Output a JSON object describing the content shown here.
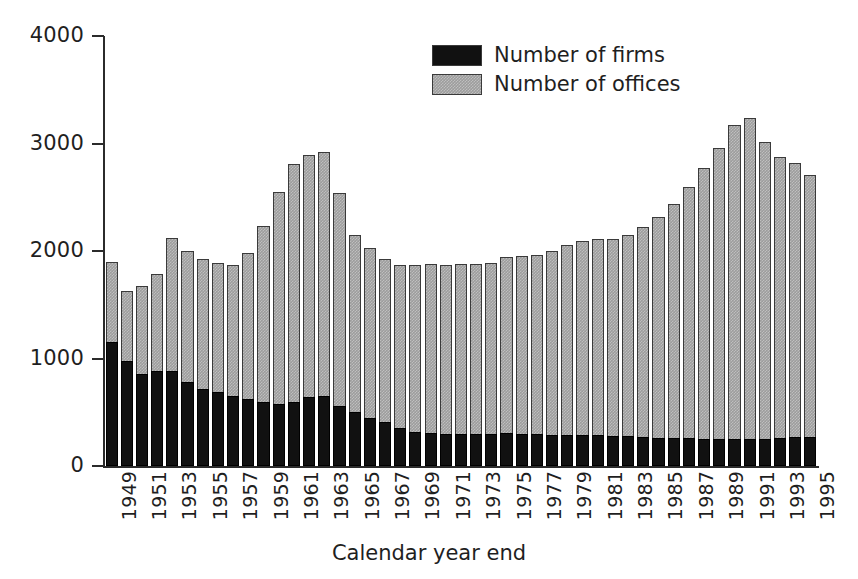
{
  "chart_data": {
    "type": "bar",
    "subtype": "stacked-vertical",
    "title": "",
    "xlabel": "Calendar year end",
    "ylabel": "",
    "ylim": [
      0,
      4000
    ],
    "ytick_values": [
      0,
      1000,
      2000,
      3000,
      4000
    ],
    "ytick_labels": [
      "0",
      "1000",
      "2000",
      "3000",
      "4000"
    ],
    "grid": false,
    "legend_position": "top-center-right",
    "colors": {
      "firms": "#111111",
      "offices": "#9d9d9d",
      "axis": "#2b2b2b",
      "text": "#1f1f1f",
      "background": "#ffffff"
    },
    "categories": [
      "1949",
      "1950",
      "1951",
      "1952",
      "1953",
      "1954",
      "1955",
      "1956",
      "1957",
      "1958",
      "1959",
      "1960",
      "1961",
      "1962",
      "1963",
      "1964",
      "1965",
      "1966",
      "1967",
      "1968",
      "1969",
      "1970",
      "1971",
      "1972",
      "1973",
      "1974",
      "1975",
      "1976",
      "1977",
      "1978",
      "1979",
      "1980",
      "1981",
      "1982",
      "1983",
      "1984",
      "1985",
      "1986",
      "1987",
      "1988",
      "1989",
      "1990",
      "1991",
      "1992",
      "1993",
      "1994",
      "1995"
    ],
    "xtick_labels": [
      "1949",
      "1951",
      "1953",
      "1955",
      "1957",
      "1959",
      "1961",
      "1963",
      "1965",
      "1967",
      "1969",
      "1971",
      "1973",
      "1975",
      "1977",
      "1979",
      "1981",
      "1983",
      "1985",
      "1987",
      "1989",
      "1991",
      "1993",
      "1995"
    ],
    "series": [
      {
        "name": "Number of firms",
        "key": "firms",
        "color": "#111111",
        "values": [
          1150,
          975,
          860,
          880,
          880,
          780,
          720,
          690,
          650,
          620,
          600,
          580,
          600,
          640,
          650,
          560,
          500,
          450,
          410,
          350,
          320,
          310,
          300,
          300,
          300,
          300,
          305,
          300,
          295,
          290,
          285,
          285,
          285,
          280,
          275,
          270,
          265,
          260,
          260,
          255,
          250,
          250,
          250,
          255,
          265,
          270,
          270
        ]
      },
      {
        "name": "Number of offices",
        "key": "offices",
        "color": "#9d9d9d",
        "values": [
          1900,
          1630,
          1670,
          1790,
          2120,
          2000,
          1930,
          1890,
          1870,
          1980,
          2230,
          2550,
          2810,
          2890,
          2920,
          2540,
          2150,
          2030,
          1930,
          1870,
          1870,
          1880,
          1870,
          1880,
          1880,
          1890,
          1940,
          1950,
          1960,
          2000,
          2060,
          2090,
          2110,
          2110,
          2150,
          2220,
          2320,
          2440,
          2600,
          2770,
          2960,
          3170,
          3240,
          3010,
          2870,
          2820,
          2710
        ]
      }
    ]
  },
  "legend": {
    "items": [
      {
        "label": "Number of firms",
        "swatch": "black-swatch"
      },
      {
        "label": "Number of offices",
        "swatch": "grey-swatch"
      }
    ]
  },
  "axes": {
    "x_title": "Calendar year end"
  }
}
